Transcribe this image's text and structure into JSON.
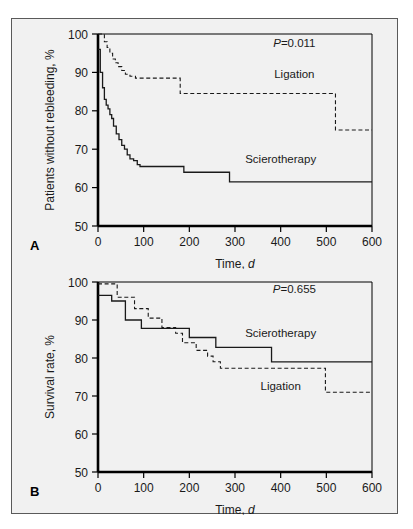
{
  "figure": {
    "background_color": "#f1f1f1",
    "border_color": "#5a5a5a",
    "curve_color": "#1a1a1a"
  },
  "chart_data": [
    {
      "type": "line",
      "panel_label": "A",
      "title": "",
      "xlabel_text": "Time, ",
      "xlabel_italic": "d",
      "ylabel": "Patients without rebleeding, %",
      "annotation_p_prefix": "P",
      "annotation_p_value": "=0.011",
      "xlim": [
        0,
        600
      ],
      "ylim": [
        50,
        100
      ],
      "xticks": [
        0,
        100,
        200,
        300,
        400,
        500,
        600
      ],
      "yticks": [
        50,
        60,
        70,
        80,
        90,
        100
      ],
      "grid": false,
      "legend_position": "inline-annotation",
      "series": [
        {
          "name": "Ligation",
          "style": "dashed",
          "label_x": 430,
          "label_y": 88.5,
          "x": [
            0,
            8,
            14,
            20,
            26,
            32,
            38,
            44,
            52,
            60,
            70,
            82,
            92,
            110,
            130,
            150,
            172,
            180,
            230,
            300,
            400,
            470,
            515,
            520,
            560,
            600
          ],
          "y": [
            100,
            100,
            98,
            96.5,
            95,
            93.5,
            92.5,
            91.5,
            90.5,
            89.5,
            89,
            88.5,
            88.5,
            88.5,
            88.5,
            88.5,
            88.5,
            84.5,
            84.5,
            84.5,
            84.5,
            84.5,
            84.5,
            75,
            75,
            75
          ]
        },
        {
          "name": "Scierotherapy",
          "style": "solid",
          "label_x": 400,
          "label_y": 66.5,
          "x": [
            0,
            5,
            10,
            14,
            18,
            22,
            26,
            30,
            34,
            40,
            46,
            52,
            58,
            64,
            70,
            78,
            86,
            92,
            120,
            150,
            180,
            188,
            230,
            280,
            288,
            340,
            400,
            500,
            600
          ],
          "y": [
            96,
            90,
            86,
            83,
            81.5,
            80.5,
            79,
            78,
            76,
            74,
            72.5,
            71,
            70,
            68.5,
            67.5,
            67,
            66,
            65.5,
            65.5,
            65.5,
            65.5,
            64,
            64,
            64,
            61.5,
            61.5,
            61.5,
            61.5,
            61.5
          ]
        }
      ]
    },
    {
      "type": "line",
      "panel_label": "B",
      "title": "",
      "xlabel_text": "Time, ",
      "xlabel_italic": "d",
      "ylabel": "Survival rate, %",
      "annotation_p_prefix": "P",
      "annotation_p_value": "=0.655",
      "xlim": [
        0,
        600
      ],
      "ylim": [
        50,
        100
      ],
      "xticks": [
        0,
        100,
        200,
        300,
        400,
        500,
        600
      ],
      "yticks": [
        50,
        60,
        70,
        80,
        90,
        100
      ],
      "grid": false,
      "legend_position": "inline-annotation",
      "series": [
        {
          "name": "Scierotherapy",
          "style": "solid",
          "label_x": 400,
          "label_y": 85.5,
          "x": [
            0,
            12,
            30,
            55,
            60,
            90,
            95,
            140,
            150,
            175,
            200,
            210,
            250,
            258,
            375,
            380,
            450,
            520,
            600
          ],
          "y": [
            96.5,
            96.5,
            95,
            95,
            90,
            90,
            87.8,
            87.8,
            87.8,
            87.8,
            85.4,
            85.4,
            85.4,
            82.8,
            82.8,
            79,
            79,
            79,
            79
          ]
        },
        {
          "name": "Ligation",
          "style": "dashed",
          "label_x": 400,
          "label_y": 71.5,
          "x": [
            0,
            10,
            42,
            50,
            80,
            95,
            110,
            125,
            140,
            155,
            170,
            185,
            200,
            215,
            230,
            240,
            252,
            262,
            268,
            330,
            420,
            490,
            498,
            545,
            600
          ],
          "y": [
            99.5,
            99.5,
            96,
            96,
            93,
            93,
            90.5,
            90.5,
            88,
            88,
            86.5,
            84,
            84,
            82,
            82,
            80.5,
            79,
            79,
            77.3,
            77.3,
            77.3,
            77.3,
            71,
            71,
            71
          ]
        }
      ]
    }
  ]
}
